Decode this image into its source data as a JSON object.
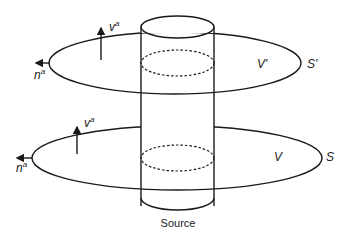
{
  "diagram": {
    "upper_surface": {
      "surface_label": "S'",
      "volume_label": "V'",
      "normal_vector": {
        "base": "n",
        "sup": "a"
      },
      "velocity_vector": {
        "base": "v",
        "sup": "a"
      }
    },
    "lower_surface": {
      "surface_label": "S",
      "volume_label": "V",
      "normal_vector": {
        "base": "n",
        "sup": "a"
      },
      "velocity_vector": {
        "base": "v",
        "sup": "a"
      }
    },
    "source_label": "Source",
    "colors": {
      "line": "#1a1a1a",
      "text": "#222222",
      "background": "#ffffff"
    }
  }
}
